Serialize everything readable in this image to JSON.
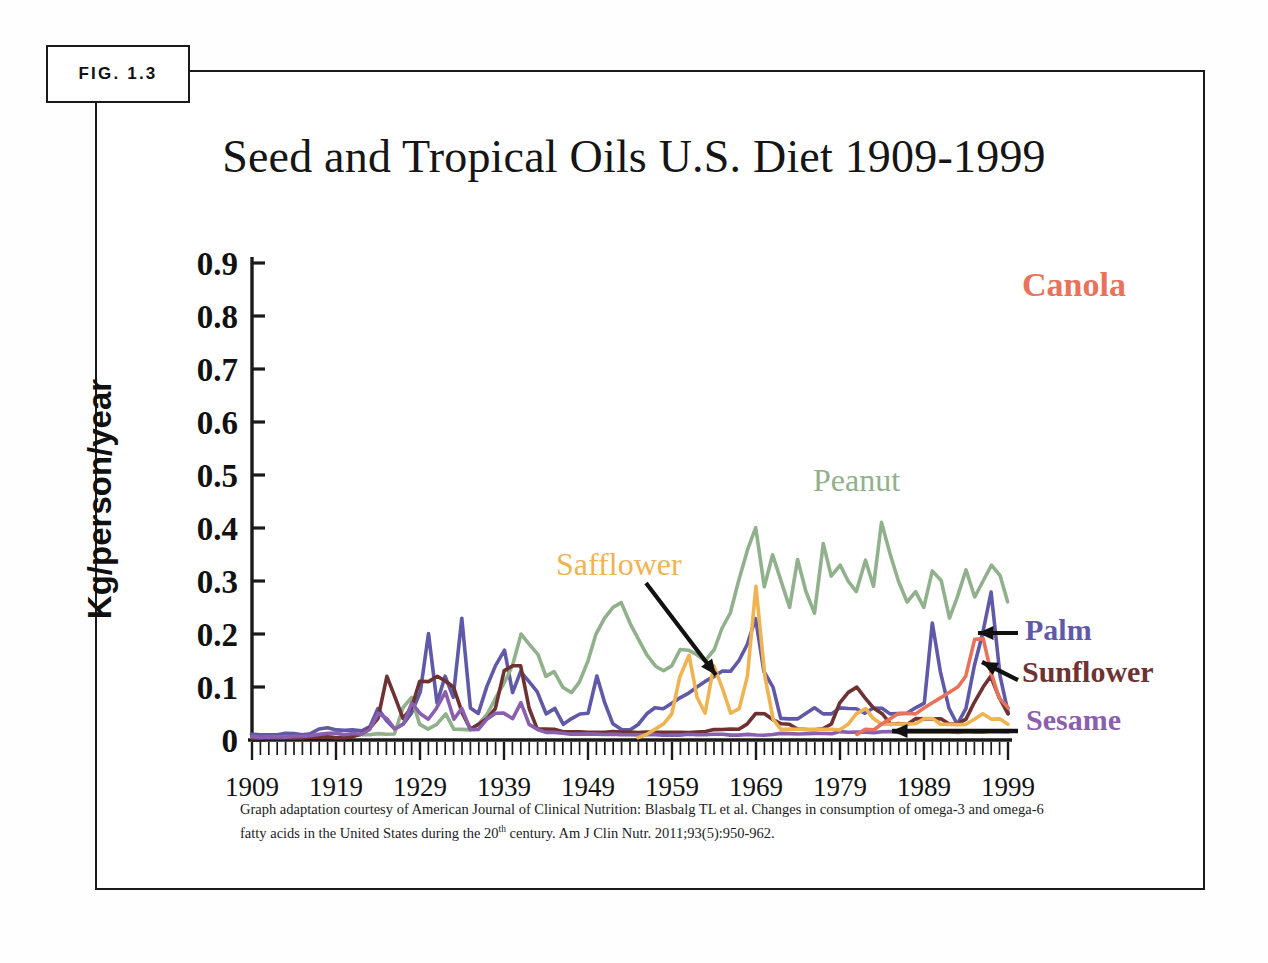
{
  "figure": {
    "badge_label": "FIG. 1.3"
  },
  "caption": {
    "line1": "Graph adaptation courtesy of American Journal of Clinical Nutrition: Blasbalg TL et al.  Changes in consumption of",
    "line2_a": "omega-3 and omega-6 fatty acids in the United States during the 20",
    "line2_sup": "th",
    "line2_b": " century. Am J Clin Nutr. 2011;93(5):950-962."
  },
  "annotations": {
    "canola": "Canola",
    "peanut": "Peanut",
    "safflower": "Safflower",
    "palm": "Palm",
    "sunflower": "Sunflower",
    "sesame": "Sesame"
  },
  "colors": {
    "canola": "#e8735a",
    "peanut": "#91b08c",
    "safflower": "#f0b352",
    "palm": "#5f59a8",
    "sunflower": "#6e3232",
    "sesame": "#8a5fae",
    "axis": "#1a1a1a",
    "frame": "#1a1a1a",
    "arrow": "#111111"
  },
  "chart_data": {
    "type": "line",
    "title": "Seed and Tropical Oils U.S. Diet 1909-1999",
    "xlabel": "",
    "ylabel": "Kg/person/year",
    "xlim": [
      1909,
      1999
    ],
    "ylim": [
      0,
      0.9
    ],
    "ytick_labels": [
      "0.9",
      "0.8",
      "0.7",
      "0.6",
      "0.5",
      "0.4",
      "0.3",
      "0.2",
      "0.1",
      "0"
    ],
    "ytick_values": [
      0.9,
      0.8,
      0.7,
      0.6,
      0.5,
      0.4,
      0.3,
      0.2,
      0.1,
      0
    ],
    "xtick_labels": [
      "1909",
      "1919",
      "1929",
      "1939",
      "1949",
      "1959",
      "1969",
      "1979",
      "1989",
      "1999"
    ],
    "xtick_values": [
      1909,
      1919,
      1929,
      1939,
      1949,
      1959,
      1969,
      1979,
      1989,
      1999
    ],
    "minor_ticks": "annual",
    "grid": false,
    "legend": "inline annotations at curve ends",
    "series": [
      {
        "name": "Palm",
        "color": "#5f59a8",
        "values": [
          0.01,
          0.01,
          0.01,
          0.01,
          0.012,
          0.012,
          0.01,
          0.012,
          0.02,
          0.022,
          0.02,
          0.018,
          0.02,
          0.018,
          0.025,
          0.06,
          0.035,
          0.02,
          0.03,
          0.05,
          0.09,
          0.2,
          0.07,
          0.12,
          0.08,
          0.23,
          0.06,
          0.05,
          0.1,
          0.14,
          0.17,
          0.09,
          0.13,
          0.11,
          0.09,
          0.05,
          0.06,
          0.03,
          0.04,
          0.05,
          0.05,
          0.12,
          0.07,
          0.03,
          0.02,
          0.02,
          0.03,
          0.05,
          0.06,
          0.06,
          0.07,
          0.08,
          0.09,
          0.1,
          0.11,
          0.12,
          0.13,
          0.13,
          0.15,
          0.18,
          0.23,
          0.13,
          0.1,
          0.04,
          0.04,
          0.04,
          0.05,
          0.06,
          0.05,
          0.05,
          0.06,
          0.06,
          0.06,
          0.05,
          0.06,
          0.06,
          0.05,
          0.05,
          0.05,
          0.06,
          0.07,
          0.22,
          0.13,
          0.06,
          0.03,
          0.06,
          0.14,
          0.2,
          0.28,
          0.12,
          0.05,
          0.12,
          0.2,
          0.18,
          0.2,
          0.2,
          0.21,
          0.14,
          0.15,
          0.14,
          0.2
        ]
      },
      {
        "name": "Peanut",
        "color": "#91b08c",
        "values": [
          0.005,
          0.005,
          0.005,
          0.005,
          0.005,
          0.005,
          0.005,
          0.006,
          0.006,
          0.006,
          0.006,
          0.007,
          0.008,
          0.01,
          0.01,
          0.012,
          0.01,
          0.012,
          0.06,
          0.08,
          0.03,
          0.02,
          0.03,
          0.05,
          0.02,
          0.02,
          0.02,
          0.03,
          0.05,
          0.08,
          0.11,
          0.14,
          0.2,
          0.18,
          0.16,
          0.12,
          0.13,
          0.1,
          0.09,
          0.11,
          0.15,
          0.2,
          0.23,
          0.25,
          0.26,
          0.22,
          0.19,
          0.16,
          0.14,
          0.13,
          0.14,
          0.17,
          0.17,
          0.16,
          0.15,
          0.17,
          0.21,
          0.24,
          0.3,
          0.36,
          0.4,
          0.29,
          0.35,
          0.3,
          0.25,
          0.34,
          0.28,
          0.24,
          0.37,
          0.31,
          0.33,
          0.3,
          0.28,
          0.34,
          0.29,
          0.41,
          0.35,
          0.3,
          0.26,
          0.28,
          0.25,
          0.32,
          0.3,
          0.23,
          0.27,
          0.32,
          0.27,
          0.3,
          0.33,
          0.31,
          0.26,
          0.3,
          0.31,
          0.31,
          0.3,
          0.32,
          0.3,
          0.29,
          0.31,
          0.32,
          0.02
        ]
      },
      {
        "name": "Sunflower",
        "color": "#6e3232",
        "values": [
          0.004,
          0.004,
          0.004,
          0.004,
          0.004,
          0.004,
          0.004,
          0.005,
          0.005,
          0.005,
          0.005,
          0.005,
          0.006,
          0.01,
          0.02,
          0.04,
          0.12,
          0.08,
          0.04,
          0.06,
          0.11,
          0.11,
          0.12,
          0.11,
          0.1,
          0.05,
          0.02,
          0.03,
          0.04,
          0.06,
          0.13,
          0.14,
          0.14,
          0.06,
          0.02,
          0.02,
          0.02,
          0.015,
          0.015,
          0.015,
          0.015,
          0.015,
          0.015,
          0.015,
          0.015,
          0.015,
          0.015,
          0.015,
          0.015,
          0.015,
          0.015,
          0.015,
          0.015,
          0.015,
          0.015,
          0.02,
          0.02,
          0.02,
          0.02,
          0.03,
          0.05,
          0.05,
          0.04,
          0.03,
          0.03,
          0.02,
          0.02,
          0.02,
          0.02,
          0.03,
          0.07,
          0.09,
          0.1,
          0.08,
          0.06,
          0.05,
          0.03,
          0.03,
          0.03,
          0.04,
          0.04,
          0.04,
          0.04,
          0.03,
          0.03,
          0.04,
          0.07,
          0.1,
          0.12,
          0.08,
          0.05,
          0.04,
          0.05,
          0.04,
          0.03,
          0.03,
          0.04,
          0.1,
          0.12,
          0.1,
          0.11
        ]
      },
      {
        "name": "Sesame",
        "color": "#8a5fae",
        "values": [
          0.006,
          0.006,
          0.006,
          0.006,
          0.006,
          0.006,
          0.006,
          0.008,
          0.01,
          0.012,
          0.012,
          0.01,
          0.012,
          0.01,
          0.02,
          0.05,
          0.04,
          0.02,
          0.03,
          0.07,
          0.05,
          0.04,
          0.06,
          0.09,
          0.04,
          0.06,
          0.02,
          0.02,
          0.04,
          0.05,
          0.05,
          0.04,
          0.07,
          0.03,
          0.02,
          0.015,
          0.015,
          0.012,
          0.012,
          0.012,
          0.012,
          0.012,
          0.01,
          0.01,
          0.01,
          0.01,
          0.01,
          0.01,
          0.01,
          0.01,
          0.01,
          0.01,
          0.01,
          0.01,
          0.01,
          0.01,
          0.01,
          0.01,
          0.01,
          0.01,
          0.01,
          0.01,
          0.01,
          0.012,
          0.012,
          0.012,
          0.012,
          0.012,
          0.012,
          0.012,
          0.015,
          0.015,
          0.015,
          0.015,
          0.015,
          0.015,
          0.015,
          0.015,
          0.015,
          0.015,
          0.015,
          0.015,
          0.015,
          0.015,
          0.015,
          0.015,
          0.015,
          0.015,
          0.015,
          0.015,
          0.015,
          0.015,
          0.015,
          0.015,
          0.015,
          0.015,
          0.015,
          0.015,
          0.015,
          0.015,
          0.015
        ]
      },
      {
        "name": "Safflower",
        "color": "#f0b352",
        "values": [
          null,
          null,
          null,
          null,
          null,
          null,
          null,
          null,
          null,
          null,
          null,
          null,
          null,
          null,
          null,
          null,
          null,
          null,
          null,
          null,
          null,
          null,
          null,
          null,
          null,
          null,
          null,
          null,
          null,
          null,
          null,
          null,
          null,
          null,
          null,
          null,
          null,
          null,
          null,
          null,
          null,
          null,
          null,
          null,
          null,
          null,
          0.005,
          0.01,
          0.02,
          0.03,
          0.05,
          0.12,
          0.16,
          0.08,
          0.05,
          0.14,
          0.1,
          0.05,
          0.06,
          0.12,
          0.29,
          0.12,
          0.04,
          0.02,
          0.02,
          0.02,
          0.02,
          0.02,
          0.02,
          0.02,
          0.02,
          0.03,
          0.05,
          0.06,
          0.04,
          0.03,
          0.03,
          0.03,
          0.03,
          0.03,
          0.04,
          0.04,
          0.03,
          0.03,
          0.03,
          0.03,
          0.04,
          0.05,
          0.04,
          0.04,
          0.03,
          0.03,
          0.03,
          0.03,
          0.03,
          0.03,
          0.03,
          0.03,
          0.03,
          0.03,
          0.03
        ]
      },
      {
        "name": "Canola",
        "color": "#e8735a",
        "values": [
          null,
          null,
          null,
          null,
          null,
          null,
          null,
          null,
          null,
          null,
          null,
          null,
          null,
          null,
          null,
          null,
          null,
          null,
          null,
          null,
          null,
          null,
          null,
          null,
          null,
          null,
          null,
          null,
          null,
          null,
          null,
          null,
          null,
          null,
          null,
          null,
          null,
          null,
          null,
          null,
          null,
          null,
          null,
          null,
          null,
          null,
          null,
          null,
          null,
          null,
          null,
          null,
          null,
          null,
          null,
          null,
          null,
          null,
          null,
          null,
          null,
          null,
          null,
          null,
          null,
          null,
          null,
          null,
          null,
          null,
          null,
          null,
          0.01,
          0.02,
          0.02,
          0.03,
          0.04,
          0.05,
          0.05,
          0.05,
          0.06,
          0.07,
          0.08,
          0.09,
          0.1,
          0.12,
          0.19,
          0.19,
          0.13,
          0.08,
          0.06,
          0.08,
          0.12,
          0.61,
          0.5,
          0.38,
          0.5,
          0.62,
          0.72,
          0.85,
          0.85
        ]
      }
    ]
  }
}
